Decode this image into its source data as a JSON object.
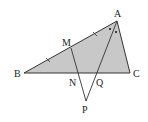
{
  "diagram": {
    "type": "geometry",
    "points": {
      "A": {
        "label": "A",
        "x": 117,
        "y": 21
      },
      "B": {
        "label": "B",
        "x": 24,
        "y": 73
      },
      "C": {
        "label": "C",
        "x": 130,
        "y": 73
      },
      "M": {
        "label": "M",
        "x": 71,
        "y": 48
      },
      "N": {
        "label": "N",
        "x": 78,
        "y": 73
      },
      "Q": {
        "label": "Q",
        "x": 96,
        "y": 73
      },
      "P": {
        "label": "P",
        "x": 86,
        "y": 101
      }
    },
    "segments": [
      "AB",
      "BC",
      "CA",
      "MP",
      "AP"
    ],
    "filled_region": "triangle ABC",
    "fill_color": "#c8c8c8",
    "stroke_color": "#333333",
    "equal_marks": [
      "BM",
      "MA"
    ],
    "angle_marks": [
      "BAQ",
      "QAC"
    ]
  }
}
